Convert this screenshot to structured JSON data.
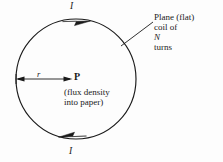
{
  "figure": {
    "kind": "physics-diagram",
    "background_color": "#fdfdfd",
    "ink_color": "#1a1a1a"
  },
  "coil": {
    "shape": "circle",
    "center_x": 76,
    "center_y": 79,
    "radius": 60,
    "current_direction": "clockwise"
  },
  "labels": {
    "current_top": "I",
    "current_bottom": "I",
    "radius": "r",
    "point": "P",
    "flux_note_line1": "(flux density",
    "flux_note_line2": "into paper)",
    "callout_line1": "Plane (flat)",
    "callout_line2_prefix": "coil of ",
    "callout_line2_symbol": "N",
    "callout_line2_suffix": " turns"
  },
  "annotations": {
    "radius_arrow": {
      "from_x": 16,
      "from_y": 79,
      "to_x": 72,
      "to_y": 79,
      "double_headed": true
    },
    "callout_leader": {
      "from_x": 121,
      "from_y": 46,
      "to_x": 153,
      "to_y": 22
    },
    "current_arrowhead_top": {
      "x": 78,
      "y": 19,
      "points": "right"
    },
    "current_arrowhead_bottom": {
      "x": 72,
      "y": 138,
      "points": "left"
    }
  }
}
